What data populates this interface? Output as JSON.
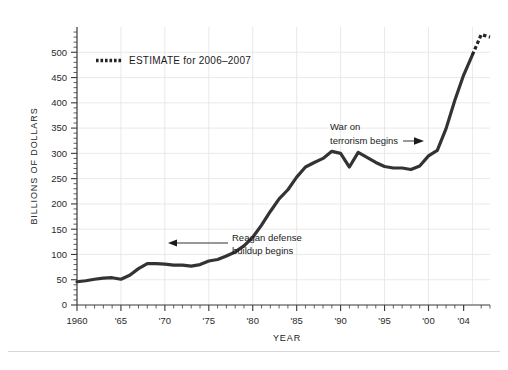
{
  "chart_data": {
    "type": "line",
    "title": "",
    "xlabel": "YEAR",
    "ylabel": "BILLIONS OF DOLLARS",
    "xlim": [
      1960,
      2007
    ],
    "ylim": [
      0,
      550
    ],
    "grid": true,
    "y_ticks": [
      0,
      50,
      100,
      150,
      200,
      250,
      300,
      350,
      400,
      450,
      500
    ],
    "y_tick_labels": [
      "0",
      "50",
      "100",
      "150",
      "200",
      "250",
      "300",
      "350",
      "400",
      "450",
      "500"
    ],
    "x_ticks": [
      1960,
      1965,
      1970,
      1975,
      1980,
      1985,
      1990,
      1995,
      2000,
      2004
    ],
    "x_tick_labels": [
      "1960",
      "'65",
      "'70",
      "'75",
      "'80",
      "'85",
      "'90",
      "'95",
      "'00",
      "'04"
    ],
    "x_minor_tick_interval": 1,
    "y_minor_tick_interval": 10,
    "legend_position": "upper-left-inside",
    "series": [
      {
        "name": "Defense spending",
        "style": "solid",
        "color": "#333335",
        "x": [
          1960,
          1961,
          1962,
          1963,
          1964,
          1965,
          1966,
          1967,
          1968,
          1969,
          1970,
          1971,
          1972,
          1973,
          1974,
          1975,
          1976,
          1977,
          1978,
          1979,
          1980,
          1981,
          1982,
          1983,
          1984,
          1985,
          1986,
          1987,
          1988,
          1989,
          1990,
          1991,
          1992,
          1993,
          1994,
          1995,
          1996,
          1997,
          1998,
          1999,
          2000,
          2001,
          2002,
          2003,
          2004,
          2005
        ],
        "values": [
          46,
          48,
          51,
          53,
          54,
          51,
          59,
          72,
          82,
          82,
          81,
          79,
          79,
          77,
          80,
          87,
          90,
          97,
          105,
          117,
          134,
          158,
          185,
          210,
          228,
          253,
          273,
          282,
          290,
          304,
          300,
          273,
          302,
          292,
          282,
          274,
          271,
          271,
          268,
          275,
          295,
          306,
          349,
          405,
          455,
          495
        ]
      },
      {
        "name": "ESTIMATE for 2006-2007",
        "style": "dotted",
        "color": "#232325",
        "x": [
          2005,
          2006,
          2007
        ],
        "values": [
          495,
          535,
          530
        ]
      }
    ],
    "annotations": [
      {
        "id": "reagan",
        "line1": "Reagan defense",
        "line2": "buildup begins",
        "arrow_direction": "left",
        "points_to_year": 1980,
        "points_to_value": 134
      },
      {
        "id": "war-on-terror",
        "line1": "War on",
        "line2": "terrorism begins",
        "arrow_direction": "right",
        "points_to_year": 2001,
        "points_to_value": 306
      }
    ]
  },
  "legend": {
    "entries": [
      {
        "label": "ESTIMATE for 2006–2007",
        "style": "dotted"
      }
    ]
  },
  "axes": {
    "y_title": "BILLIONS OF DOLLARS",
    "x_title": "YEAR"
  },
  "colors": {
    "series": "#333335",
    "estimate": "#232325",
    "gridline": "#e3e3e5",
    "axis": "#3a3a3a",
    "text": "#1b1b1b",
    "background": "#ffffff"
  }
}
